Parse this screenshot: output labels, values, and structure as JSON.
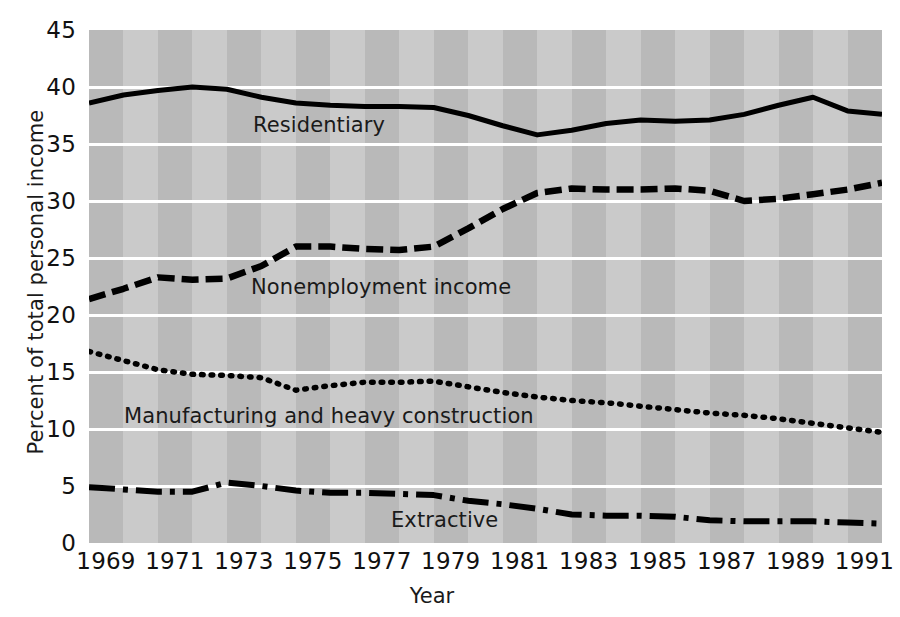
{
  "chart_data": {
    "type": "line",
    "title": "",
    "xlabel": "Year",
    "ylabel": "Percent of total personal income",
    "xlim": [
      1969,
      1992
    ],
    "ylim": [
      0,
      45
    ],
    "ytick_labels": [
      "45",
      "40",
      "35",
      "30",
      "25",
      "20",
      "15",
      "10",
      "5",
      "0"
    ],
    "yticks": [
      45,
      40,
      35,
      30,
      25,
      20,
      15,
      10,
      5,
      0
    ],
    "xtick_labels": [
      "1969",
      "1971",
      "1973",
      "1975",
      "1977",
      "1979",
      "1981",
      "1983",
      "1985",
      "1987",
      "1989",
      "1991"
    ],
    "xticks": [
      1969,
      1971,
      1973,
      1975,
      1977,
      1979,
      1981,
      1983,
      1985,
      1987,
      1989,
      1991
    ],
    "grid": "horizontal-white-gridlines-on-banded-gray-background",
    "legend_position": "inline-labels-on-plot",
    "x": [
      1969,
      1970,
      1971,
      1972,
      1973,
      1974,
      1975,
      1976,
      1977,
      1978,
      1979,
      1980,
      1981,
      1982,
      1983,
      1984,
      1985,
      1986,
      1987,
      1988,
      1989,
      1990,
      1991,
      1992
    ],
    "series": [
      {
        "name": "Residentiary",
        "style": "solid",
        "values": [
          38.6,
          39.3,
          39.7,
          40.0,
          39.8,
          39.1,
          38.6,
          38.4,
          38.3,
          38.3,
          38.2,
          37.5,
          36.6,
          35.8,
          36.2,
          36.8,
          37.1,
          37.0,
          37.1,
          37.6,
          38.4,
          39.1,
          37.9,
          37.6
        ],
        "label_text": "Residentiary"
      },
      {
        "name": "Nonemployment income",
        "style": "dashed",
        "values": [
          21.4,
          22.3,
          23.3,
          23.1,
          23.2,
          24.3,
          26.0,
          26.0,
          25.8,
          25.7,
          26.0,
          27.6,
          29.3,
          30.7,
          31.1,
          31.0,
          31.0,
          31.1,
          30.9,
          30.0,
          30.2,
          30.6,
          31.0,
          31.6
        ],
        "label_text": "Nonemployment income"
      },
      {
        "name": "Manufacturing and heavy construction",
        "style": "dotted",
        "values": [
          16.8,
          16.0,
          15.2,
          14.8,
          14.7,
          14.5,
          13.4,
          13.8,
          14.1,
          14.1,
          14.2,
          13.7,
          13.2,
          12.8,
          12.5,
          12.3,
          12.0,
          11.7,
          11.4,
          11.2,
          10.9,
          10.5,
          10.1,
          9.7
        ],
        "label_text": "Manufacturing and heavy construction"
      },
      {
        "name": "Extractive",
        "style": "dash-dot",
        "values": [
          4.9,
          4.7,
          4.5,
          4.5,
          5.3,
          5.0,
          4.6,
          4.4,
          4.4,
          4.3,
          4.2,
          3.7,
          3.4,
          3.0,
          2.5,
          2.4,
          2.4,
          2.3,
          2.0,
          1.9,
          1.9,
          1.9,
          1.8,
          1.7
        ],
        "label_text": "Extractive"
      }
    ],
    "colors": {
      "line": "#000000",
      "gridline": "#ffffff",
      "band_dark": "#b9b9b9",
      "band_light": "#cacaca",
      "text": "#1a1a1a"
    }
  }
}
